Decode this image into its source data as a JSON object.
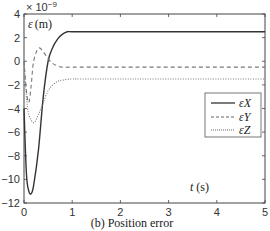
{
  "chart_data": {
    "type": "line",
    "title": "",
    "caption": "(b) Position error",
    "xlabel": "t (s)",
    "ylabel": "ε (m)",
    "y_multiplier": "× 10^-9",
    "xlim": [
      0,
      5
    ],
    "ylim": [
      -12,
      4
    ],
    "xticks": [
      "0",
      "1",
      "2",
      "3",
      "4",
      "5"
    ],
    "yticks": [
      "4",
      "2",
      "0",
      "-2",
      "-4",
      "-6",
      "-8",
      "-10",
      "-12"
    ],
    "grid": false,
    "legend_position": "center right",
    "series": [
      {
        "name": "εX",
        "style": "solid",
        "x": [
          0,
          0.05,
          0.1,
          0.15,
          0.2,
          0.3,
          0.4,
          0.5,
          0.6,
          0.7,
          0.8,
          0.9,
          1.0,
          1.5,
          5
        ],
        "y": [
          -4,
          -9.5,
          -11,
          -11.2,
          -10.5,
          -7.5,
          -3,
          0,
          1.2,
          1.9,
          2.3,
          2.5,
          2.5,
          2.5,
          2.5
        ]
      },
      {
        "name": "εY",
        "style": "dashed",
        "x": [
          0,
          0.05,
          0.1,
          0.15,
          0.2,
          0.3,
          0.4,
          0.5,
          0.6,
          0.7,
          0.8,
          1.0,
          1.5,
          5
        ],
        "y": [
          0,
          -2.5,
          -3.5,
          -2,
          0,
          1.1,
          0.8,
          0.2,
          -0.2,
          -0.4,
          -0.5,
          -0.5,
          -0.5,
          -0.5
        ]
      },
      {
        "name": "εZ",
        "style": "dotted",
        "x": [
          0,
          0.05,
          0.1,
          0.2,
          0.3,
          0.4,
          0.5,
          0.6,
          0.7,
          0.8,
          1.0,
          1.5,
          5
        ],
        "y": [
          0,
          -3,
          -4.5,
          -5.2,
          -4.5,
          -3.5,
          -2.5,
          -2,
          -1.7,
          -1.6,
          -1.5,
          -1.5,
          -1.5
        ]
      }
    ]
  },
  "labels": {
    "multiplier_prefix": "× 10",
    "multiplier_exp": "−9",
    "ylabel_sym": "ε",
    "ylabel_unit": "(m)",
    "xlabel_sym": "t",
    "xlabel_unit": "(s)",
    "caption": "(b) Position error",
    "legend_x": "εX",
    "legend_y": "εY",
    "legend_z": "εZ"
  }
}
